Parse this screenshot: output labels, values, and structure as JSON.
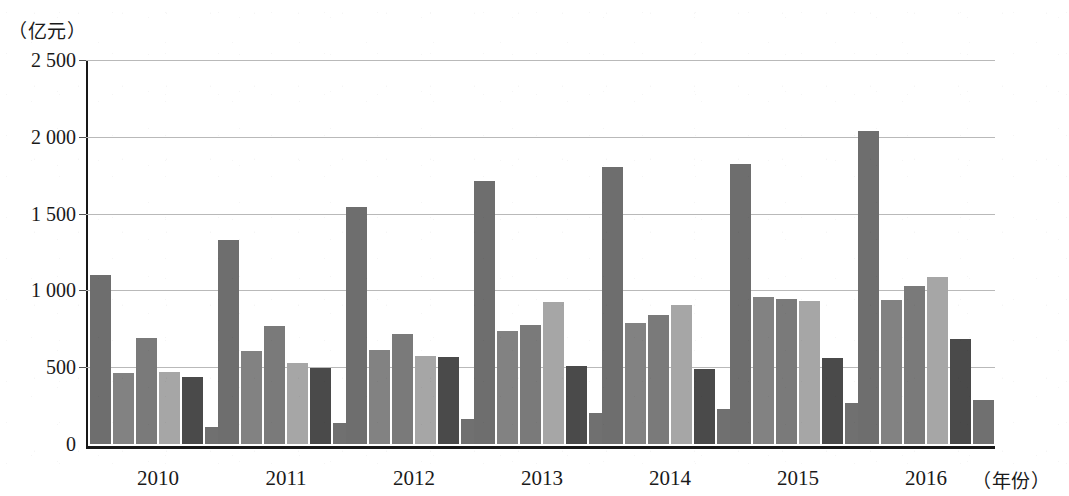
{
  "chart_data": {
    "type": "bar",
    "title": "",
    "subtitle": "",
    "ylabel": "（亿元）",
    "xlabel": "（年份）",
    "categories": [
      "2010",
      "2011",
      "2012",
      "2013",
      "2014",
      "2015",
      "2016"
    ],
    "ylim": [
      0,
      2500
    ],
    "y_ticks": [
      0,
      500,
      1000,
      1500,
      2000,
      2500
    ],
    "y_tick_labels": [
      "0",
      "500",
      "1 000",
      "1 500",
      "2 000",
      "2 500"
    ],
    "grid": true,
    "legend": "none",
    "series": [
      {
        "name": "series-1",
        "color": "#6e6e6e",
        "values": [
          1100,
          1330,
          1540,
          1710,
          1805,
          1820,
          2040
        ]
      },
      {
        "name": "series-2",
        "color": "#828282",
        "values": [
          465,
          605,
          610,
          735,
          785,
          955,
          940
        ]
      },
      {
        "name": "series-3",
        "color": "#7a7a7a",
        "values": [
          690,
          770,
          715,
          775,
          840,
          945,
          1030
        ]
      },
      {
        "name": "series-4",
        "color": "#a6a6a6",
        "values": [
          470,
          525,
          575,
          925,
          905,
          930,
          1090
        ]
      },
      {
        "name": "series-5",
        "color": "#4a4a4a",
        "values": [
          435,
          495,
          565,
          510,
          490,
          560,
          685
        ]
      },
      {
        "name": "series-6",
        "color": "#707070",
        "values": [
          110,
          140,
          160,
          200,
          230,
          265,
          285
        ]
      }
    ]
  },
  "axis": {
    "unit_y": "（亿元）",
    "unit_x": "（年份）"
  }
}
